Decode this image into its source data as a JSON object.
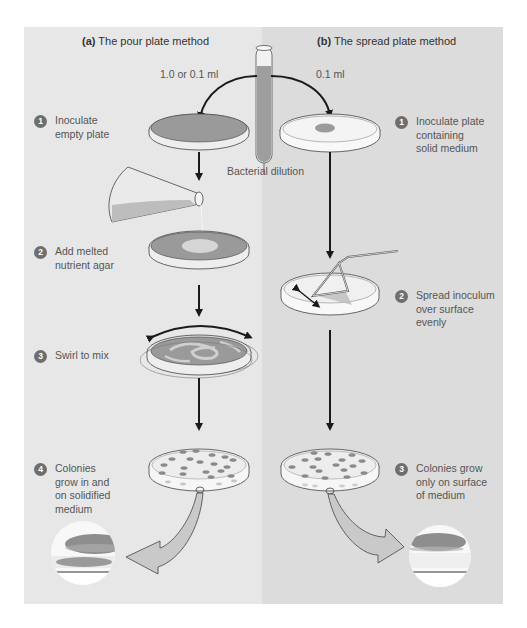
{
  "figure": {
    "left_panel": {
      "letter": "(a)",
      "title": "The pour plate method",
      "volume_label": "1.0 or 0.1 ml",
      "steps": [
        {
          "number": "1",
          "lines": [
            "Inoculate",
            "empty plate"
          ]
        },
        {
          "number": "2",
          "lines": [
            "Add melted",
            "nutrient agar"
          ]
        },
        {
          "number": "3",
          "lines": [
            "Swirl to mix"
          ]
        },
        {
          "number": "4",
          "lines": [
            "Colonies",
            "grow in and",
            "on solidified",
            "medium"
          ]
        }
      ]
    },
    "right_panel": {
      "letter": "(b)",
      "title": "The spread plate method",
      "volume_label": "0.1 ml",
      "steps": [
        {
          "number": "1",
          "lines": [
            "Inoculate plate",
            "containing",
            "solid medium"
          ]
        },
        {
          "number": "2",
          "lines": [
            "Spread inoculum",
            "over surface",
            "evenly"
          ]
        },
        {
          "number": "3",
          "lines": [
            "Colonies grow",
            "only on surface",
            "of medium"
          ]
        }
      ]
    },
    "center": {
      "tube_label": "Bacterial dilution"
    },
    "colors": {
      "left_bg": "#e7e7e7",
      "right_bg": "#dcdcdc",
      "agar": "#9a9a9a",
      "colony": "#8a8a8a",
      "badge": "#6e6e6e",
      "arrow": "#1a1a1a"
    }
  }
}
